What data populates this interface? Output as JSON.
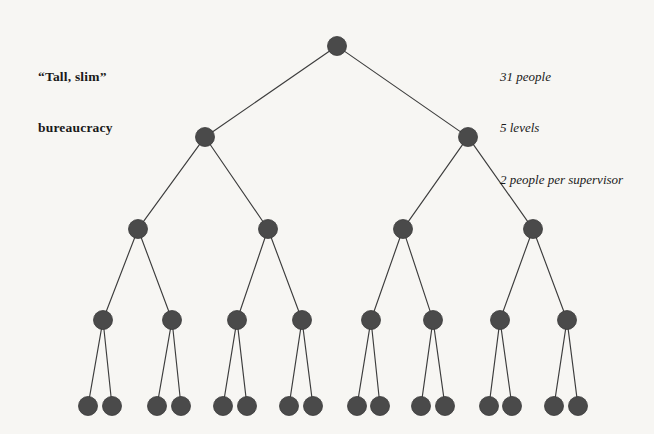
{
  "figure": {
    "title_caption": {
      "line1": "“Tall, slim”",
      "line2": "bureaucracy"
    },
    "stats": {
      "line1": "31 people",
      "line2": "5 levels",
      "line3": "2 people per supervisor"
    }
  },
  "style": {
    "background": "#f7f6f3",
    "node_fill": "#4a4a4a",
    "node_stroke": "#3a3a3a",
    "edge_color": "#3d3d3d",
    "text_color": "#1a1a1a"
  },
  "chart_data": {
    "type": "diagram",
    "diagram_kind": "tree",
    "title": "“Tall, slim” bureaucracy",
    "total_nodes": 31,
    "levels": 5,
    "branching_factor": 2,
    "annotations": [
      "31 people",
      "5 levels",
      "2 people per supervisor"
    ],
    "levels_detail": [
      {
        "level": 1,
        "count": 1,
        "y": 46,
        "radius": 9.5
      },
      {
        "level": 2,
        "count": 2,
        "y": 137,
        "radius": 9.5
      },
      {
        "level": 3,
        "count": 4,
        "y": 229,
        "radius": 9.5
      },
      {
        "level": 4,
        "count": 8,
        "y": 320,
        "radius": 9.5
      },
      {
        "level": 5,
        "count": 16,
        "y": 406,
        "radius": 9.5
      }
    ],
    "nodes": [
      {
        "id": "n1",
        "level": 1,
        "x": 337,
        "y": 46,
        "parent": null
      },
      {
        "id": "n2",
        "level": 2,
        "x": 205,
        "y": 137,
        "parent": "n1"
      },
      {
        "id": "n3",
        "level": 2,
        "x": 468,
        "y": 137,
        "parent": "n1"
      },
      {
        "id": "n4",
        "level": 3,
        "x": 138,
        "y": 229,
        "parent": "n2"
      },
      {
        "id": "n5",
        "level": 3,
        "x": 268,
        "y": 229,
        "parent": "n2"
      },
      {
        "id": "n6",
        "level": 3,
        "x": 403,
        "y": 229,
        "parent": "n3"
      },
      {
        "id": "n7",
        "level": 3,
        "x": 533,
        "y": 229,
        "parent": "n3"
      },
      {
        "id": "n8",
        "level": 4,
        "x": 103,
        "y": 320,
        "parent": "n4"
      },
      {
        "id": "n9",
        "level": 4,
        "x": 172,
        "y": 320,
        "parent": "n4"
      },
      {
        "id": "n10",
        "level": 4,
        "x": 237,
        "y": 320,
        "parent": "n5"
      },
      {
        "id": "n11",
        "level": 4,
        "x": 302,
        "y": 320,
        "parent": "n5"
      },
      {
        "id": "n12",
        "level": 4,
        "x": 371,
        "y": 320,
        "parent": "n6"
      },
      {
        "id": "n13",
        "level": 4,
        "x": 433,
        "y": 320,
        "parent": "n6"
      },
      {
        "id": "n14",
        "level": 4,
        "x": 500,
        "y": 320,
        "parent": "n7"
      },
      {
        "id": "n15",
        "level": 4,
        "x": 567,
        "y": 320,
        "parent": "n7"
      },
      {
        "id": "n16",
        "level": 5,
        "x": 88,
        "y": 406,
        "parent": "n8"
      },
      {
        "id": "n17",
        "level": 5,
        "x": 112,
        "y": 406,
        "parent": "n8"
      },
      {
        "id": "n18",
        "level": 5,
        "x": 157,
        "y": 406,
        "parent": "n9"
      },
      {
        "id": "n19",
        "level": 5,
        "x": 181,
        "y": 406,
        "parent": "n9"
      },
      {
        "id": "n20",
        "level": 5,
        "x": 223,
        "y": 406,
        "parent": "n10"
      },
      {
        "id": "n21",
        "level": 5,
        "x": 247,
        "y": 406,
        "parent": "n10"
      },
      {
        "id": "n22",
        "level": 5,
        "x": 289,
        "y": 406,
        "parent": "n11"
      },
      {
        "id": "n23",
        "level": 5,
        "x": 313,
        "y": 406,
        "parent": "n11"
      },
      {
        "id": "n24",
        "level": 5,
        "x": 357,
        "y": 406,
        "parent": "n12"
      },
      {
        "id": "n25",
        "level": 5,
        "x": 380,
        "y": 406,
        "parent": "n12"
      },
      {
        "id": "n26",
        "level": 5,
        "x": 421,
        "y": 406,
        "parent": "n13"
      },
      {
        "id": "n27",
        "level": 5,
        "x": 445,
        "y": 406,
        "parent": "n13"
      },
      {
        "id": "n28",
        "level": 5,
        "x": 489,
        "y": 406,
        "parent": "n14"
      },
      {
        "id": "n29",
        "level": 5,
        "x": 512,
        "y": 406,
        "parent": "n14"
      },
      {
        "id": "n30",
        "level": 5,
        "x": 554,
        "y": 406,
        "parent": "n15"
      },
      {
        "id": "n31",
        "level": 5,
        "x": 578,
        "y": 406,
        "parent": "n15"
      }
    ]
  }
}
